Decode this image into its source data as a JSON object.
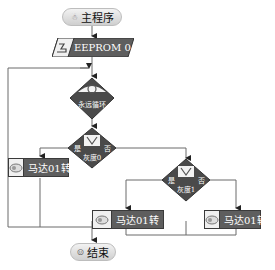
{
  "flowchart": {
    "start": {
      "label": "主程序",
      "icon": "program-icon"
    },
    "eeprom": {
      "label": "EEPROM 0",
      "icon": "write-icon"
    },
    "loop": {
      "label": "永远循环",
      "icon": "loop-icon"
    },
    "decision1": {
      "label": "灰度0",
      "yes_label": "是",
      "no_label": "否",
      "icon": "sensor-icon"
    },
    "decision2": {
      "label": "灰度1",
      "yes_label": "是",
      "no_label": "否",
      "icon": "sensor-icon"
    },
    "motor_left": {
      "label": "马达01转",
      "icon": "motor-icon"
    },
    "motor_middle": {
      "label": "马达01转",
      "icon": "motor-icon"
    },
    "motor_right": {
      "label": "马达01转",
      "icon": "motor-icon"
    },
    "end": {
      "label": "结束",
      "icon": "end-icon"
    }
  },
  "colors": {
    "block_fill": "#5e5e5e",
    "diamond_fill": "#4a4a4a",
    "line": "#555555",
    "pill_fill": "#dcdcdc"
  }
}
